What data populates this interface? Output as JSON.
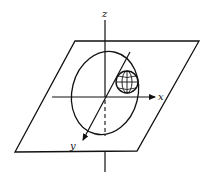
{
  "diagram": {
    "type": "3d-coordinate-system",
    "stroke_color": "#111111",
    "background": "#ffffff",
    "axes": {
      "x": {
        "label": "x"
      },
      "y": {
        "label": "y"
      },
      "z": {
        "label": "z"
      }
    },
    "elements": [
      {
        "name": "plane",
        "shape": "parallelogram"
      },
      {
        "name": "ellipse",
        "shape": "ellipse"
      },
      {
        "name": "sphere",
        "shape": "circle-with-grid"
      }
    ]
  }
}
